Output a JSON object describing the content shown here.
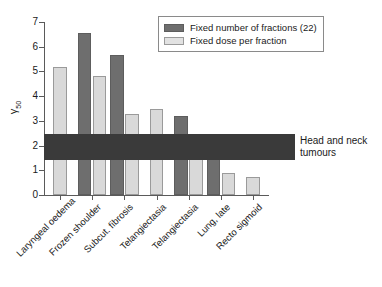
{
  "chart_data": {
    "type": "bar",
    "title": "",
    "xlabel": "",
    "ylabel": "γ₅₀",
    "ylabel_base": "γ",
    "ylabel_sub": "50",
    "ylim": [
      0,
      7
    ],
    "yticks": [
      0,
      1,
      2,
      3,
      4,
      5,
      6,
      7
    ],
    "ytick_labels": [
      "0",
      "1",
      "2",
      "3",
      "4",
      "5",
      "6",
      "7"
    ],
    "grid": false,
    "legend_position": "top-right",
    "categories": [
      "Laryngeal oedema",
      "Frozen shoulder",
      "Subcut. fibrosis",
      "Telangiectasia",
      "Telangiectasia",
      "Lung, late",
      "Recto sigmoid"
    ],
    "series": [
      {
        "name": "Fixed number of fractions (22)",
        "color": "#6e6e6e",
        "values": [
          null,
          6.55,
          5.65,
          null,
          3.18,
          1.7,
          null
        ]
      },
      {
        "name": "Fixed dose per fraction",
        "color": "#d9d9d9",
        "values": [
          5.2,
          4.8,
          3.28,
          3.48,
          2.15,
          0.9,
          0.72
        ]
      }
    ],
    "annotation_band": {
      "label_line1": "Head and neck",
      "label_line2": "tumours",
      "y_min": 1.42,
      "y_max": 2.45,
      "color": "#3a3a3a"
    }
  },
  "legend": {
    "items": [
      {
        "label": "Fixed number of fractions (22)",
        "swatch": "dark"
      },
      {
        "label": "Fixed dose per fraction",
        "swatch": "light"
      }
    ]
  }
}
